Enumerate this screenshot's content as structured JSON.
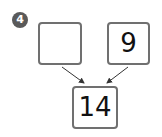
{
  "problem": {
    "number": "4",
    "left_value": "",
    "right_value": "9",
    "result_value": "14"
  },
  "colors": {
    "badge": "#5a5a5a",
    "border": "#707070",
    "arrow": "#333333"
  }
}
